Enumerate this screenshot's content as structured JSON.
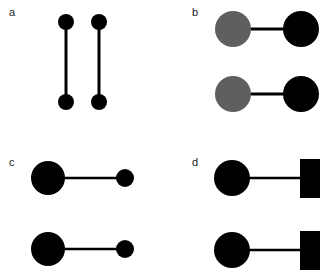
{
  "panels": [
    {
      "label": "a",
      "description": "two vertical dumbbells: small black circles connected by vertical line"
    },
    {
      "label": "b",
      "description": "gray circle connected to black circle, two rows"
    },
    {
      "label": "c",
      "description": "large black circle connected to small black circle, two rows"
    },
    {
      "label": "d",
      "description": "black circle connected to black rectangle, two rows"
    }
  ],
  "colors": {
    "black": "#000000",
    "gray": "#5f5f5f",
    "background": "#ffffff"
  }
}
